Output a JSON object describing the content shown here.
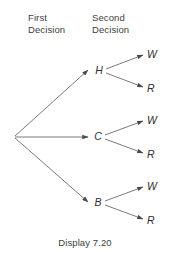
{
  "figure": {
    "caption": "Display 7.20",
    "background_color": "#ffffff",
    "line_color": "#6b6b6b",
    "text_color": "#3b3b3b"
  },
  "headers": {
    "first": "First\nDecision",
    "second": "Second\nDecision"
  },
  "tree": {
    "root": {
      "name": "root-node",
      "x": 14,
      "y": 137
    },
    "first_decision_nodes": [
      {
        "id": "H",
        "label": "H",
        "x": 98,
        "y": 71
      },
      {
        "id": "C",
        "label": "C",
        "x": 97,
        "y": 137
      },
      {
        "id": "B",
        "label": "B",
        "x": 97,
        "y": 203
      }
    ],
    "second_decision_leaves": [
      {
        "parent": "H",
        "id": "H-W",
        "label": "W",
        "x": 150,
        "y": 55
      },
      {
        "parent": "H",
        "id": "H-R",
        "label": "R",
        "x": 150,
        "y": 89
      },
      {
        "parent": "C",
        "id": "C-W",
        "label": "W",
        "x": 150,
        "y": 121
      },
      {
        "parent": "C",
        "id": "C-R",
        "label": "R",
        "x": 150,
        "y": 155
      },
      {
        "parent": "B",
        "id": "B-W",
        "label": "W",
        "x": 150,
        "y": 187
      },
      {
        "parent": "B",
        "id": "B-R",
        "label": "R",
        "x": 150,
        "y": 221
      }
    ],
    "edges": [
      {
        "id": "root-to-H",
        "from": "root",
        "to": "H"
      },
      {
        "id": "root-to-C",
        "from": "root",
        "to": "C"
      },
      {
        "id": "root-to-B",
        "from": "root",
        "to": "B"
      },
      {
        "id": "H-to-W",
        "from": "H",
        "to": "H-W"
      },
      {
        "id": "H-to-R",
        "from": "H",
        "to": "H-R"
      },
      {
        "id": "C-to-W",
        "from": "C",
        "to": "C-W"
      },
      {
        "id": "C-to-R",
        "from": "C",
        "to": "C-R"
      },
      {
        "id": "B-to-W",
        "from": "B",
        "to": "B-W"
      },
      {
        "id": "B-to-R",
        "from": "B",
        "to": "B-R"
      }
    ]
  }
}
